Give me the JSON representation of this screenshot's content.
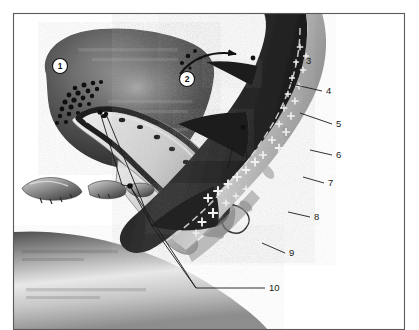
{
  "figure": {
    "frame": {
      "border_color": "#5a5a5a",
      "background": "#ffffff",
      "x": 13,
      "y": 13,
      "width": 392,
      "height": 317
    },
    "palette": {
      "ink": "#111111",
      "dark_tissue": "#242424",
      "mid_tissue": "#6b6b6b",
      "light_tissue": "#b9b9b9",
      "pale_tissue": "#dedede",
      "highlight": "#f2f2f2",
      "leader_line": "#1a1a1a",
      "label_text": "#1a1a1a"
    },
    "callouts": [
      {
        "id": "callout-1",
        "label": "1",
        "style": "circled-white",
        "cx": 60,
        "cy": 66,
        "r": 7.5
      },
      {
        "id": "callout-2",
        "label": "2",
        "style": "circled-white",
        "cx": 187,
        "cy": 79,
        "r": 7.5
      }
    ],
    "labels": [
      {
        "id": "label-3",
        "label": "3",
        "text_x": 306,
        "text_y": 64,
        "leader": false,
        "leader_path": ""
      },
      {
        "id": "label-4",
        "label": "4",
        "text_x": 326,
        "text_y": 94,
        "leader": true,
        "leader_path": "M 322 91 L 287 83"
      },
      {
        "id": "label-5",
        "label": "5",
        "text_x": 336,
        "text_y": 127,
        "leader": true,
        "leader_path": "M 332 124 L 300 113"
      },
      {
        "id": "label-6",
        "label": "6",
        "text_x": 336,
        "text_y": 158,
        "leader": true,
        "leader_path": "M 332 155 L 310 150"
      },
      {
        "id": "label-7",
        "label": "7",
        "text_x": 328,
        "text_y": 186,
        "leader": true,
        "leader_path": "M 324 183 L 303 177"
      },
      {
        "id": "label-8",
        "label": "8",
        "text_x": 314,
        "text_y": 220,
        "leader": true,
        "leader_path": "M 310 217 L 288 212"
      },
      {
        "id": "label-9",
        "label": "9",
        "text_x": 289,
        "text_y": 256,
        "leader": true,
        "leader_path": "M 285 253 L 262 243"
      },
      {
        "id": "label-10",
        "label": "10",
        "text_x": 269,
        "text_y": 291,
        "leader": true,
        "leader_path": "M 265 288 L 196 288 L 130 186"
      }
    ],
    "leaders_internal": [
      {
        "id": "leader-tissue-a",
        "path": "M 243 127 L 234 139 L 228 168"
      },
      {
        "id": "leader-tissue-b",
        "path": "M 243 127 L 247 160 L 236 170"
      },
      {
        "id": "leader-nerve-a",
        "path": "M 100 112 L 122 185 L 130 186"
      },
      {
        "id": "leader-nerve-b",
        "path": "M 106 114 L 140 196 L 152 226"
      },
      {
        "id": "leader-bone-a",
        "path": "M 130 186 L 152 226 L 196 288"
      }
    ],
    "arrow": {
      "id": "migration-arrow",
      "path": "M 180 74 C 192 58, 212 50, 236 54",
      "head_x": 238,
      "head_y": 54,
      "particles": [
        {
          "cx": 182,
          "cy": 63,
          "r": 2.1
        },
        {
          "cx": 188,
          "cy": 56,
          "r": 2.3
        },
        {
          "cx": 195,
          "cy": 51,
          "r": 1.9
        },
        {
          "cx": 190,
          "cy": 68,
          "r": 1.6
        },
        {
          "cx": 200,
          "cy": 58,
          "r": 1.5
        },
        {
          "cx": 253,
          "cy": 58,
          "r": 2.4
        }
      ]
    },
    "cell_dots": [
      {
        "cx": 75,
        "cy": 88,
        "r": 2.3
      },
      {
        "cx": 84,
        "cy": 85,
        "r": 2.5
      },
      {
        "cx": 93,
        "cy": 83,
        "r": 2.3
      },
      {
        "cx": 101,
        "cy": 82,
        "r": 2.1
      },
      {
        "cx": 69,
        "cy": 95,
        "r": 2.4
      },
      {
        "cx": 78,
        "cy": 93,
        "r": 2.6
      },
      {
        "cx": 88,
        "cy": 91,
        "r": 2.4
      },
      {
        "cx": 97,
        "cy": 89,
        "r": 2.2
      },
      {
        "cx": 65,
        "cy": 102,
        "r": 2.5
      },
      {
        "cx": 74,
        "cy": 100,
        "r": 2.6
      },
      {
        "cx": 83,
        "cy": 98,
        "r": 2.4
      },
      {
        "cx": 92,
        "cy": 96,
        "r": 2.2
      },
      {
        "cx": 62,
        "cy": 109,
        "r": 2.4
      },
      {
        "cx": 71,
        "cy": 107,
        "r": 2.5
      },
      {
        "cx": 80,
        "cy": 105,
        "r": 2.3
      },
      {
        "cx": 89,
        "cy": 104,
        "r": 2.1
      },
      {
        "cx": 60,
        "cy": 116,
        "r": 2.2
      },
      {
        "cx": 69,
        "cy": 114,
        "r": 2.3
      },
      {
        "cx": 78,
        "cy": 113,
        "r": 2.1
      },
      {
        "cx": 57,
        "cy": 123,
        "r": 2.0
      },
      {
        "cx": 66,
        "cy": 122,
        "r": 2.1
      },
      {
        "cx": 96,
        "cy": 113,
        "r": 2.3
      },
      {
        "cx": 101,
        "cy": 118,
        "r": 2.2
      },
      {
        "cx": 106,
        "cy": 112,
        "r": 2.1
      }
    ],
    "cross_marks": [
      {
        "x": 300,
        "y": 47,
        "s": 3.2
      },
      {
        "x": 306,
        "y": 56,
        "s": 3.0
      },
      {
        "x": 296,
        "y": 62,
        "s": 2.8
      },
      {
        "x": 303,
        "y": 70,
        "s": 3.2
      },
      {
        "x": 292,
        "y": 78,
        "s": 3.0
      },
      {
        "x": 299,
        "y": 86,
        "s": 3.4
      },
      {
        "x": 288,
        "y": 94,
        "s": 3.2
      },
      {
        "x": 295,
        "y": 101,
        "s": 3.6
      },
      {
        "x": 284,
        "y": 108,
        "s": 3.4
      },
      {
        "x": 291,
        "y": 116,
        "s": 3.8
      },
      {
        "x": 279,
        "y": 124,
        "s": 3.6
      },
      {
        "x": 286,
        "y": 132,
        "s": 4.0
      },
      {
        "x": 272,
        "y": 140,
        "s": 3.8
      },
      {
        "x": 279,
        "y": 148,
        "s": 4.2
      },
      {
        "x": 263,
        "y": 155,
        "s": 4.0
      },
      {
        "x": 255,
        "y": 162,
        "s": 4.4
      },
      {
        "x": 246,
        "y": 170,
        "s": 4.2
      },
      {
        "x": 237,
        "y": 177,
        "s": 4.6
      },
      {
        "x": 228,
        "y": 184,
        "s": 4.4
      },
      {
        "x": 218,
        "y": 191,
        "s": 4.8
      },
      {
        "x": 208,
        "y": 198,
        "s": 4.6
      },
      {
        "x": 246,
        "y": 189,
        "s": 3.4
      },
      {
        "x": 236,
        "y": 196,
        "s": 3.2
      },
      {
        "x": 226,
        "y": 203,
        "s": 3.6
      },
      {
        "x": 213,
        "y": 213,
        "s": 5.0
      },
      {
        "x": 202,
        "y": 222,
        "s": 4.4
      },
      {
        "x": 196,
        "y": 233,
        "s": 3.4
      }
    ],
    "bone_fragments": [
      {
        "id": "bone-fragment-1",
        "cx": 50,
        "cy": 190
      },
      {
        "id": "bone-fragment-2",
        "cx": 105,
        "cy": 190
      },
      {
        "id": "bone-fragment-3",
        "cx": 138,
        "cy": 192
      }
    ]
  }
}
